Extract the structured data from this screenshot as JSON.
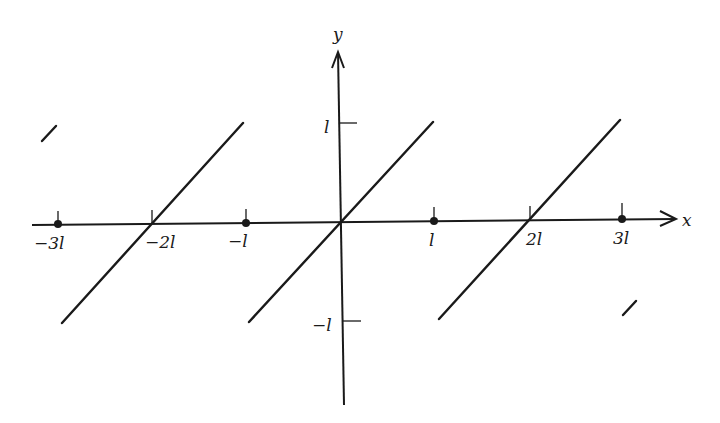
{
  "figure": {
    "type": "sawtooth-periodic-extension",
    "axes": {
      "x_label": "x",
      "y_label": "y",
      "x_ticks": [
        {
          "value": -3,
          "label": "−3l",
          "px": 58,
          "dot": true
        },
        {
          "value": -2,
          "label": "−2l",
          "px": 152,
          "dot": false
        },
        {
          "value": -1,
          "label": "−l",
          "px": 246,
          "dot": true
        },
        {
          "value": 1,
          "label": "l",
          "px": 434,
          "dot": true
        },
        {
          "value": 2,
          "label": "2l",
          "px": 528,
          "dot": false
        },
        {
          "value": 3,
          "label": "3l",
          "px": 622,
          "dot": true
        }
      ],
      "y_ticks": [
        {
          "value": 1,
          "label": "l",
          "py": 123
        },
        {
          "value": -1,
          "label": "−l",
          "py": 321
        }
      ]
    },
    "segments": [
      {
        "name": "segment-centered-minus-2l",
        "x1": 62,
        "y1": 323,
        "x2": 243,
        "y2": 123
      },
      {
        "name": "segment-centered-origin",
        "x1": 249,
        "y1": 322,
        "x2": 433,
        "y2": 122
      },
      {
        "name": "segment-centered-2l",
        "x1": 439,
        "y1": 319,
        "x2": 620,
        "y2": 120
      },
      {
        "name": "segment-partial-left",
        "x1": 42,
        "y1": 141,
        "x2": 56,
        "y2": 126
      },
      {
        "name": "segment-partial-right",
        "x1": 623,
        "y1": 315,
        "x2": 636,
        "y2": 301
      }
    ],
    "labels": {
      "x_axis": "x",
      "y_axis": "y",
      "xt_m3": "−3l",
      "xt_m2": "−2l",
      "xt_m1": "−l",
      "xt_1": "l",
      "xt_2": "2l",
      "xt_3": "3l",
      "yt_1": "l",
      "yt_m1": "−l"
    }
  }
}
